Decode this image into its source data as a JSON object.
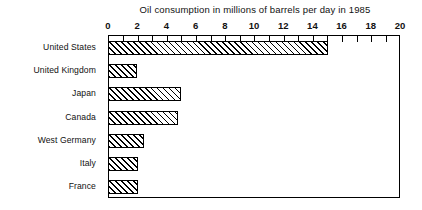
{
  "chart_data": {
    "type": "bar",
    "orientation": "horizontal",
    "title": "Oil consumption in millions of barrels per day in 1985",
    "xlabel": "",
    "ylabel": "",
    "xlim": [
      0,
      20
    ],
    "x_major_step": 2,
    "x_minor_step": 1,
    "grid": false,
    "legend": false,
    "categories": [
      "United States",
      "United Kingdom",
      "Japan",
      "Canada",
      "West Germany",
      "Italy",
      "France"
    ],
    "values": [
      15.0,
      1.9,
      4.9,
      4.7,
      2.4,
      2.0,
      2.0
    ],
    "tick_labels": [
      "0",
      "2",
      "4",
      "6",
      "8",
      "10",
      "12",
      "14",
      "16",
      "18",
      "20"
    ],
    "tick_values": [
      0,
      2,
      4,
      6,
      8,
      10,
      12,
      14,
      16,
      18,
      20
    ],
    "bar_fill": "diagonal-hatch",
    "bar_outline_color": "#000000",
    "background_color": "#ffffff"
  }
}
